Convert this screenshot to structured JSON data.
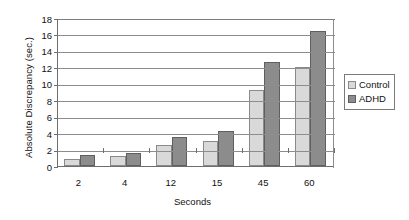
{
  "chart_data": {
    "type": "bar",
    "title": "",
    "xlabel": "Seconds",
    "ylabel": "Absolute Discrepancy (sec.)",
    "categories": [
      "2",
      "4",
      "12",
      "15",
      "45",
      "60"
    ],
    "series": [
      {
        "name": "Control",
        "color": "#d9d9d9",
        "values": [
          0.8,
          1.2,
          2.6,
          3.0,
          9.3,
          12.0
        ]
      },
      {
        "name": "ADHD",
        "color": "#8c8c8c",
        "values": [
          1.4,
          1.6,
          3.5,
          4.2,
          12.6,
          16.4
        ]
      }
    ],
    "ylim": [
      0,
      18
    ],
    "yticks": [
      0,
      2,
      4,
      6,
      8,
      10,
      12,
      14,
      16,
      18
    ],
    "ytick_labels": [
      "0",
      "2",
      "4",
      "6",
      "8",
      "10",
      "12",
      "14",
      "16",
      "18"
    ],
    "grid": true,
    "legend_position": "right",
    "legend_entries": [
      "Control",
      "ADHD"
    ]
  }
}
